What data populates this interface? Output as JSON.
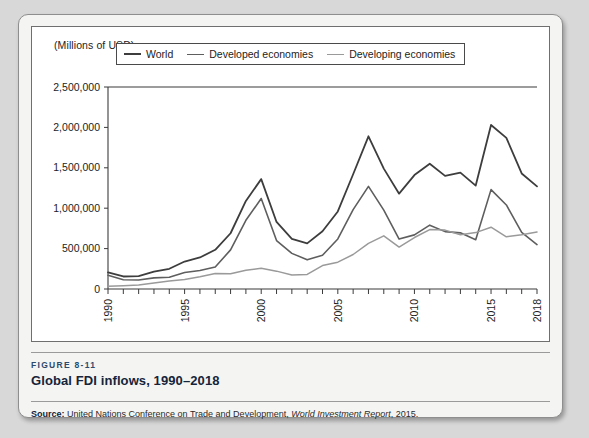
{
  "figure": {
    "number_label": "FIGURE 8-11",
    "title": "Global FDI inflows, 1990–2018",
    "source_label": "Source:",
    "source_text_a": " United Nations Conference on Trade and Development, ",
    "source_italic": "World Investment Report",
    "source_text_b": ", 2015."
  },
  "chart_data": {
    "type": "line",
    "title": "Global FDI inflows, 1990–2018",
    "subtitle": "",
    "xlabel": "",
    "ylabel": "(Millions of USD)",
    "unit_label": "(Millions of USD)",
    "ylim": [
      0,
      2500000
    ],
    "xlim": [
      1990,
      2018
    ],
    "grid": false,
    "legend_position": "top-left-inside",
    "y_ticks": [
      0,
      500000,
      1000000,
      1500000,
      2000000,
      2500000
    ],
    "y_tick_labels": [
      "0",
      "500,000",
      "1,000,000",
      "1,500,000",
      "2,000,000",
      "2,500,000"
    ],
    "x": [
      1990,
      1991,
      1992,
      1993,
      1994,
      1995,
      1996,
      1997,
      1998,
      1999,
      2000,
      2001,
      2002,
      2003,
      2004,
      2005,
      2006,
      2007,
      2008,
      2009,
      2010,
      2011,
      2012,
      2013,
      2014,
      2015,
      2016,
      2017,
      2018
    ],
    "x_tick_labels": [
      "1990",
      "1995",
      "2000",
      "2005",
      "2010",
      "2015",
      "2018"
    ],
    "x_labeled_years": [
      1990,
      1995,
      2000,
      2005,
      2010,
      2015,
      2018
    ],
    "series": [
      {
        "name": "World",
        "color": "#3d3d3d",
        "width": 1.8,
        "values": [
          205000,
          155000,
          160000,
          215000,
          250000,
          340000,
          390000,
          485000,
          690000,
          1090000,
          1360000,
          830000,
          620000,
          565000,
          715000,
          960000,
          1420000,
          1890000,
          1490000,
          1180000,
          1410000,
          1550000,
          1400000,
          1440000,
          1280000,
          2030000,
          1870000,
          1430000,
          1270000
        ]
      },
      {
        "name": "Developed economies",
        "color": "#5e5e5e",
        "width": 1.6,
        "values": [
          170000,
          115000,
          111000,
          138000,
          146000,
          205000,
          228000,
          273000,
          484000,
          850000,
          1120000,
          600000,
          441000,
          361000,
          418000,
          619000,
          982000,
          1270000,
          976000,
          618000,
          670000,
          790000,
          710000,
          695000,
          610000,
          1230000,
          1040000,
          700000,
          550000
        ]
      },
      {
        "name": "Developing economies",
        "color": "#9a9a9a",
        "width": 1.5,
        "values": [
          35000,
          41000,
          50000,
          74000,
          100000,
          118000,
          152000,
          191000,
          188000,
          231000,
          256000,
          221000,
          173000,
          180000,
          290000,
          332000,
          427000,
          565000,
          658000,
          519000,
          637000,
          735000,
          729000,
          671000,
          698000,
          765000,
          646000,
          671000,
          706000
        ]
      }
    ]
  },
  "legend": {
    "items": [
      {
        "label": "World",
        "color": "#3d3d3d"
      },
      {
        "label": "Developed economies",
        "color": "#5e5e5e"
      },
      {
        "label": "Developing economies",
        "color": "#9a9a9a"
      }
    ]
  }
}
